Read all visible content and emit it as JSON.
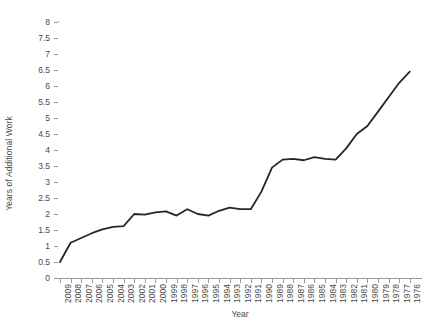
{
  "chart_data": {
    "type": "line",
    "title": "",
    "subtitle": "",
    "xlabel": "Year",
    "ylabel": "Years of Additional Work",
    "xlim": [
      2009,
      1976
    ],
    "ylim": [
      0,
      8
    ],
    "y_tick_step": 0.5,
    "grid": false,
    "legend": null,
    "x_axis_reversed": true,
    "x_tick_rotation": -90,
    "line_color": "#262626",
    "line_width": 1.8,
    "markers": false,
    "categories": [
      "2009",
      "2008",
      "2007",
      "2006",
      "2005",
      "2004",
      "2003",
      "2002",
      "2001",
      "2000",
      "1999",
      "1998",
      "1997",
      "1996",
      "1995",
      "1994",
      "1993",
      "1992",
      "1991",
      "1990",
      "1989",
      "1988",
      "1987",
      "1986",
      "1985",
      "1984",
      "1983",
      "1982",
      "1981",
      "1980",
      "1979",
      "1978",
      "1977",
      "1976"
    ],
    "series": [
      {
        "name": "Years of Additional Work",
        "values": [
          0.5,
          1.1,
          1.25,
          1.4,
          1.52,
          1.6,
          1.62,
          2.0,
          1.98,
          2.05,
          2.08,
          1.95,
          2.15,
          2.0,
          1.95,
          2.1,
          2.2,
          2.15,
          2.15,
          2.7,
          3.45,
          3.7,
          3.72,
          3.68,
          3.78,
          3.72,
          3.7,
          4.05,
          4.5,
          4.75,
          5.2,
          5.65,
          6.1,
          6.45
        ]
      }
    ],
    "y_tick_labels": [
      "8",
      "7.5",
      "7",
      "6.5",
      "6",
      "5.5",
      "5",
      "4.5",
      "4",
      "3.5",
      "3",
      "2.5",
      "2",
      "1.5",
      "1",
      "0.5",
      "0"
    ],
    "y_tick_values": [
      8,
      7.5,
      7,
      6.5,
      6,
      5.5,
      5,
      4.5,
      4,
      3.5,
      3,
      2.5,
      2,
      1.5,
      1,
      0.5,
      0
    ]
  }
}
